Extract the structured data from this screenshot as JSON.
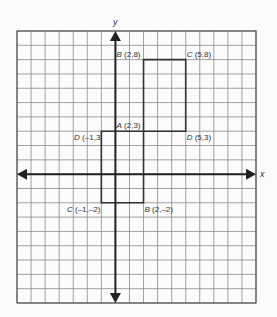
{
  "diagram": {
    "type": "coordinate-grid",
    "axes": {
      "x_label": "x",
      "y_label": "y",
      "x_range": [
        -7,
        10
      ],
      "y_range": [
        -9,
        10
      ]
    },
    "colors": {
      "background": "#fbfbfb",
      "grid": "#8a8a8a",
      "border": "#555555",
      "axis": "#222222",
      "shape": "#333333",
      "label": "#333333"
    },
    "shapes": [
      {
        "name": "upper-rectangle",
        "vertices": [
          [
            2,
            3
          ],
          [
            2,
            8
          ],
          [
            5,
            8
          ],
          [
            5,
            3
          ]
        ]
      },
      {
        "name": "lower-rectangle",
        "vertices": [
          [
            -1,
            3
          ],
          [
            2,
            3
          ],
          [
            2,
            -2
          ],
          [
            -1,
            -2
          ]
        ]
      }
    ],
    "labels": [
      {
        "id": "B-upper",
        "letter": "B",
        "coords": " (2,8)",
        "x": 2,
        "y": 8,
        "anchor": "above-left"
      },
      {
        "id": "C-upper",
        "letter": "C",
        "coords": " (5,8)",
        "x": 5,
        "y": 8,
        "anchor": "above-right"
      },
      {
        "id": "A",
        "letter": "A",
        "coords": " (2,3)",
        "x": 2,
        "y": 3,
        "anchor": "above-left"
      },
      {
        "id": "D-left",
        "letter": "D",
        "coords": " (–1,3",
        "x": -1,
        "y": 3,
        "anchor": "below-left"
      },
      {
        "id": "D-right",
        "letter": "D",
        "coords": " (5,3)",
        "x": 5,
        "y": 3,
        "anchor": "below-right"
      },
      {
        "id": "C-lower",
        "letter": "C",
        "coords": " (–1,–2)",
        "x": -1,
        "y": -2,
        "anchor": "below-left"
      },
      {
        "id": "B-lower",
        "letter": "B",
        "coords": " (2,–2)",
        "x": 2,
        "y": -2,
        "anchor": "below-right"
      }
    ]
  }
}
